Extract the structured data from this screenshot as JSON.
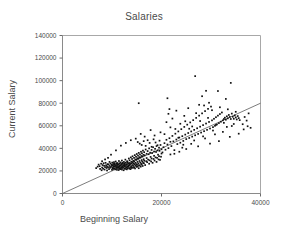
{
  "chart_data": {
    "type": "scatter",
    "title": "Salaries",
    "xlabel": "Beginning Salary",
    "ylabel": "Current Salary",
    "xlim": [
      0,
      40000
    ],
    "ylim": [
      0,
      140000
    ],
    "xticks": [
      0,
      20000,
      40000
    ],
    "yticks": [
      0,
      20000,
      40000,
      60000,
      80000,
      100000,
      120000,
      140000
    ],
    "xtick_labels": [
      "0",
      "20000",
      "40000"
    ],
    "ytick_labels": [
      "0",
      "20000",
      "40000",
      "60000",
      "80000",
      "100000",
      "120000",
      "140000"
    ],
    "grid": false,
    "legend": null,
    "marker": "square",
    "marker_color": "#111111",
    "fit_line": {
      "label": "regression-line",
      "color": "#5a5a5a",
      "x0": 0,
      "y0": 0,
      "x1": 40000,
      "y1": 80000
    },
    "points": [
      [
        6800,
        22500
      ],
      [
        7100,
        23800
      ],
      [
        7300,
        25600
      ],
      [
        7500,
        24200
      ],
      [
        7600,
        21800
      ],
      [
        7800,
        26400
      ],
      [
        7900,
        20600
      ],
      [
        8000,
        23000
      ],
      [
        8100,
        25200
      ],
      [
        8200,
        22000
      ],
      [
        8300,
        26800
      ],
      [
        8400,
        24600
      ],
      [
        8500,
        21200
      ],
      [
        8600,
        23400
      ],
      [
        8700,
        27200
      ],
      [
        8800,
        25000
      ],
      [
        8900,
        22600
      ],
      [
        9000,
        24000
      ],
      [
        9000,
        20400
      ],
      [
        9100,
        26000
      ],
      [
        9200,
        23200
      ],
      [
        9300,
        25800
      ],
      [
        9400,
        21600
      ],
      [
        9500,
        24400
      ],
      [
        9500,
        28000
      ],
      [
        9600,
        22800
      ],
      [
        9700,
        26600
      ],
      [
        9800,
        23600
      ],
      [
        9900,
        25400
      ],
      [
        10000,
        21000
      ],
      [
        10000,
        24800
      ],
      [
        10050,
        27400
      ],
      [
        10100,
        22400
      ],
      [
        10150,
        25000
      ],
      [
        10200,
        23000
      ],
      [
        10250,
        26200
      ],
      [
        10300,
        24200
      ],
      [
        10350,
        21800
      ],
      [
        10400,
        27800
      ],
      [
        10450,
        25600
      ],
      [
        10500,
        22200
      ],
      [
        10500,
        24000
      ],
      [
        10550,
        26400
      ],
      [
        10600,
        23800
      ],
      [
        10650,
        25200
      ],
      [
        10700,
        21400
      ],
      [
        10750,
        28400
      ],
      [
        10800,
        24600
      ],
      [
        10850,
        22600
      ],
      [
        10900,
        26800
      ],
      [
        10950,
        23400
      ],
      [
        11000,
        25800
      ],
      [
        11000,
        21000
      ],
      [
        11050,
        24400
      ],
      [
        11100,
        27000
      ],
      [
        11150,
        22800
      ],
      [
        11200,
        26000
      ],
      [
        11250,
        23200
      ],
      [
        11300,
        25400
      ],
      [
        11350,
        20800
      ],
      [
        11400,
        24000
      ],
      [
        11400,
        28800
      ],
      [
        11450,
        22000
      ],
      [
        11500,
        26600
      ],
      [
        11550,
        23600
      ],
      [
        11600,
        25000
      ],
      [
        11650,
        21600
      ],
      [
        11700,
        27600
      ],
      [
        11750,
        24800
      ],
      [
        11800,
        22400
      ],
      [
        11850,
        26200
      ],
      [
        11900,
        23000
      ],
      [
        11950,
        25600
      ],
      [
        12000,
        21200
      ],
      [
        12000,
        29200
      ],
      [
        12050,
        24200
      ],
      [
        12100,
        27200
      ],
      [
        12150,
        22600
      ],
      [
        12200,
        26400
      ],
      [
        12250,
        23400
      ],
      [
        12300,
        25200
      ],
      [
        12350,
        20600
      ],
      [
        12400,
        28000
      ],
      [
        12450,
        24600
      ],
      [
        12500,
        22200
      ],
      [
        12500,
        26800
      ],
      [
        12550,
        23800
      ],
      [
        12600,
        25800
      ],
      [
        12650,
        21800
      ],
      [
        12700,
        30000
      ],
      [
        12750,
        24400
      ],
      [
        12800,
        27400
      ],
      [
        12850,
        22800
      ],
      [
        12900,
        26000
      ],
      [
        12950,
        23200
      ],
      [
        13000,
        25400
      ],
      [
        13000,
        21400
      ],
      [
        13050,
        28600
      ],
      [
        13100,
        24000
      ],
      [
        13150,
        27800
      ],
      [
        13200,
        22400
      ],
      [
        13250,
        26600
      ],
      [
        13300,
        23600
      ],
      [
        13350,
        25000
      ],
      [
        13400,
        31000
      ],
      [
        13450,
        24800
      ],
      [
        13500,
        22000
      ],
      [
        13500,
        27000
      ],
      [
        13550,
        29400
      ],
      [
        13600,
        25600
      ],
      [
        13650,
        23000
      ],
      [
        13700,
        26200
      ],
      [
        13750,
        21600
      ],
      [
        13800,
        32000
      ],
      [
        13850,
        24200
      ],
      [
        13900,
        28200
      ],
      [
        13950,
        22600
      ],
      [
        14000,
        26800
      ],
      [
        14000,
        23400
      ],
      [
        14050,
        30600
      ],
      [
        14100,
        25200
      ],
      [
        14150,
        33000
      ],
      [
        14200,
        27600
      ],
      [
        14250,
        22800
      ],
      [
        14300,
        29000
      ],
      [
        14350,
        24400
      ],
      [
        14400,
        26400
      ],
      [
        14450,
        31600
      ],
      [
        14500,
        23200
      ],
      [
        14500,
        28400
      ],
      [
        14550,
        25800
      ],
      [
        14600,
        34000
      ],
      [
        14650,
        22200
      ],
      [
        14700,
        30200
      ],
      [
        14750,
        27200
      ],
      [
        14800,
        24600
      ],
      [
        14850,
        32600
      ],
      [
        14900,
        26000
      ],
      [
        14950,
        29800
      ],
      [
        15000,
        23600
      ],
      [
        15000,
        35000
      ],
      [
        15050,
        25400
      ],
      [
        15100,
        31200
      ],
      [
        15150,
        28000
      ],
      [
        15200,
        24000
      ],
      [
        15250,
        33600
      ],
      [
        15300,
        26600
      ],
      [
        15350,
        30800
      ],
      [
        15400,
        22400
      ],
      [
        15400,
        36000
      ],
      [
        15450,
        25000
      ],
      [
        15500,
        32200
      ],
      [
        15550,
        28800
      ],
      [
        15600,
        24800
      ],
      [
        15650,
        34600
      ],
      [
        15700,
        27400
      ],
      [
        15750,
        31800
      ],
      [
        15800,
        23800
      ],
      [
        15850,
        37000
      ],
      [
        15900,
        26200
      ],
      [
        15950,
        33200
      ],
      [
        16000,
        29600
      ],
      [
        16000,
        25600
      ],
      [
        16050,
        35600
      ],
      [
        16100,
        28200
      ],
      [
        16150,
        32800
      ],
      [
        16200,
        24400
      ],
      [
        16250,
        38000
      ],
      [
        16300,
        27000
      ],
      [
        16350,
        34200
      ],
      [
        16400,
        30400
      ],
      [
        16450,
        26800
      ],
      [
        16500,
        36600
      ],
      [
        16500,
        29000
      ],
      [
        16600,
        33800
      ],
      [
        16700,
        25200
      ],
      [
        16800,
        39000
      ],
      [
        16900,
        28600
      ],
      [
        17000,
        35200
      ],
      [
        17000,
        31400
      ],
      [
        17100,
        27800
      ],
      [
        17200,
        37600
      ],
      [
        17300,
        30000
      ],
      [
        17400,
        34800
      ],
      [
        17500,
        26400
      ],
      [
        17500,
        40000
      ],
      [
        17600,
        29400
      ],
      [
        17700,
        36200
      ],
      [
        17800,
        32400
      ],
      [
        17900,
        28400
      ],
      [
        18000,
        38600
      ],
      [
        18000,
        31000
      ],
      [
        18100,
        35800
      ],
      [
        18200,
        27200
      ],
      [
        18300,
        41000
      ],
      [
        18400,
        30600
      ],
      [
        18500,
        37200
      ],
      [
        18500,
        33400
      ],
      [
        18600,
        29200
      ],
      [
        18700,
        39600
      ],
      [
        18800,
        32000
      ],
      [
        18900,
        36800
      ],
      [
        19000,
        28000
      ],
      [
        19000,
        42000
      ],
      [
        19100,
        31600
      ],
      [
        19200,
        38200
      ],
      [
        19300,
        34400
      ],
      [
        19400,
        30200
      ],
      [
        19500,
        40600
      ],
      [
        19500,
        33000
      ],
      [
        19600,
        37800
      ],
      [
        19700,
        29800
      ],
      [
        19800,
        43000
      ],
      [
        19900,
        32600
      ],
      [
        20000,
        39200
      ],
      [
        20000,
        35400
      ],
      [
        15200,
        45600
      ],
      [
        15600,
        44200
      ],
      [
        16000,
        43000
      ],
      [
        16400,
        46400
      ],
      [
        16800,
        42200
      ],
      [
        17200,
        47200
      ],
      [
        17600,
        44800
      ],
      [
        18000,
        41400
      ],
      [
        18400,
        48000
      ],
      [
        18800,
        45200
      ],
      [
        19200,
        42800
      ],
      [
        19600,
        46800
      ],
      [
        20200,
        36400
      ],
      [
        20400,
        41000
      ],
      [
        20600,
        44600
      ],
      [
        20800,
        38800
      ],
      [
        21000,
        47600
      ],
      [
        21200,
        43400
      ],
      [
        21400,
        40200
      ],
      [
        21600,
        49000
      ],
      [
        21800,
        45800
      ],
      [
        22000,
        42000
      ],
      [
        22200,
        51000
      ],
      [
        22400,
        46200
      ],
      [
        22600,
        38400
      ],
      [
        22800,
        53000
      ],
      [
        23000,
        47800
      ],
      [
        23200,
        43800
      ],
      [
        23400,
        55000
      ],
      [
        23600,
        49600
      ],
      [
        23800,
        45000
      ],
      [
        24000,
        57000
      ],
      [
        24200,
        50800
      ],
      [
        24400,
        46600
      ],
      [
        24600,
        59000
      ],
      [
        24800,
        52200
      ],
      [
        25000,
        48200
      ],
      [
        25200,
        61000
      ],
      [
        25400,
        53600
      ],
      [
        25600,
        49200
      ],
      [
        25800,
        63000
      ],
      [
        26000,
        55000
      ],
      [
        26200,
        50400
      ],
      [
        26400,
        65000
      ],
      [
        26600,
        56400
      ],
      [
        26800,
        51600
      ],
      [
        27000,
        67000
      ],
      [
        27200,
        57800
      ],
      [
        27400,
        52800
      ],
      [
        27600,
        69000
      ],
      [
        27800,
        59200
      ],
      [
        28000,
        54000
      ],
      [
        28200,
        71000
      ],
      [
        28400,
        60600
      ],
      [
        28600,
        55200
      ],
      [
        28800,
        73000
      ],
      [
        29000,
        62000
      ],
      [
        29200,
        56400
      ],
      [
        29400,
        75000
      ],
      [
        29600,
        63400
      ],
      [
        29800,
        57600
      ],
      [
        30000,
        77000
      ],
      [
        30200,
        64800
      ],
      [
        30400,
        58800
      ],
      [
        30600,
        66200
      ],
      [
        30800,
        60000
      ],
      [
        31000,
        67600
      ],
      [
        31200,
        61200
      ],
      [
        31400,
        69000
      ],
      [
        31600,
        62400
      ],
      [
        31800,
        70400
      ],
      [
        32000,
        63600
      ],
      [
        32200,
        71800
      ],
      [
        32400,
        64800
      ],
      [
        32600,
        66000
      ],
      [
        32800,
        67200
      ],
      [
        33000,
        65400
      ],
      [
        33200,
        68400
      ],
      [
        33400,
        66600
      ],
      [
        33600,
        69600
      ],
      [
        33800,
        67800
      ],
      [
        34000,
        66000
      ],
      [
        34200,
        70800
      ],
      [
        34400,
        68000
      ],
      [
        34600,
        66200
      ],
      [
        34800,
        69200
      ],
      [
        35000,
        67400
      ],
      [
        35200,
        65600
      ],
      [
        35400,
        68600
      ],
      [
        35600,
        66800
      ],
      [
        21000,
        63200
      ],
      [
        21400,
        70600
      ],
      [
        21800,
        58600
      ],
      [
        22200,
        66400
      ],
      [
        23000,
        73400
      ],
      [
        23800,
        61800
      ],
      [
        24600,
        68800
      ],
      [
        25400,
        75600
      ],
      [
        26200,
        59400
      ],
      [
        27000,
        71200
      ],
      [
        27800,
        64200
      ],
      [
        28600,
        78000
      ],
      [
        29400,
        67000
      ],
      [
        30200,
        73800
      ],
      [
        31000,
        60800
      ],
      [
        31800,
        76400
      ],
      [
        32600,
        62600
      ],
      [
        33400,
        74600
      ],
      [
        34200,
        59800
      ],
      [
        35000,
        72400
      ],
      [
        35800,
        65000
      ],
      [
        36400,
        61400
      ],
      [
        36800,
        67800
      ],
      [
        37200,
        64600
      ],
      [
        37600,
        71000
      ],
      [
        38000,
        58200
      ],
      [
        15400,
        80000
      ],
      [
        21200,
        84400
      ],
      [
        21600,
        74800
      ],
      [
        22800,
        57200
      ],
      [
        26800,
        104000
      ],
      [
        29000,
        91000
      ],
      [
        31400,
        90800
      ],
      [
        34000,
        98000
      ],
      [
        33000,
        83800
      ],
      [
        29600,
        80400
      ],
      [
        27600,
        78600
      ],
      [
        28200,
        86200
      ],
      [
        24800,
        64000
      ],
      [
        25600,
        57400
      ],
      [
        23400,
        49400
      ],
      [
        20600,
        52600
      ],
      [
        19800,
        54200
      ],
      [
        18600,
        51400
      ],
      [
        17800,
        56200
      ],
      [
        16600,
        50400
      ],
      [
        15800,
        52800
      ],
      [
        14800,
        48600
      ],
      [
        13800,
        47200
      ],
      [
        12800,
        44800
      ],
      [
        11800,
        42400
      ],
      [
        10800,
        38200
      ],
      [
        9800,
        34400
      ],
      [
        9200,
        31600
      ],
      [
        8600,
        30200
      ],
      [
        8000,
        28600
      ],
      [
        22600,
        35200
      ],
      [
        24200,
        40600
      ],
      [
        26000,
        44000
      ],
      [
        28800,
        48800
      ],
      [
        30800,
        52400
      ],
      [
        32400,
        54600
      ],
      [
        33800,
        50200
      ],
      [
        35600,
        53000
      ],
      [
        36600,
        56800
      ],
      [
        37400,
        59600
      ],
      [
        31600,
        46400
      ],
      [
        29800,
        44200
      ],
      [
        27400,
        41800
      ],
      [
        25000,
        39400
      ],
      [
        23600,
        37000
      ],
      [
        21800,
        34600
      ],
      [
        34600,
        61600
      ],
      [
        33200,
        59000
      ],
      [
        30400,
        55800
      ],
      [
        28400,
        50600
      ],
      [
        26600,
        47000
      ],
      [
        24400,
        43200
      ]
    ]
  }
}
